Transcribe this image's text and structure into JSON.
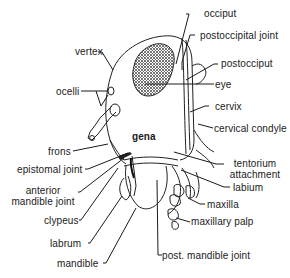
{
  "diagram": {
    "type": "labeled anatomical illustration",
    "labels": {
      "occiput": "occiput",
      "postoccipital_joint": "postoccipital joint",
      "vertex": "vertex",
      "postocciput": "postocciput",
      "ocelli": "ocelli",
      "eye": "eye",
      "cervix": "cervix",
      "gena": "gena",
      "cervical_condyle": "cervical condyle",
      "frons": "frons",
      "epistomal_joint": "epistomal joint",
      "tentorium_attachment_1": "tentorium",
      "tentorium_attachment_2": "attachment",
      "anterior_mandible_joint_1": "anterior",
      "anterior_mandible_joint_2": "mandible joint",
      "labium": "labium",
      "maxilla": "maxilla",
      "clypeus": "clypeus",
      "maxillary_palp": "maxillary palp",
      "labrum": "labrum",
      "post_mandible_joint": "post. mandible joint",
      "mandible": "mandible"
    }
  }
}
